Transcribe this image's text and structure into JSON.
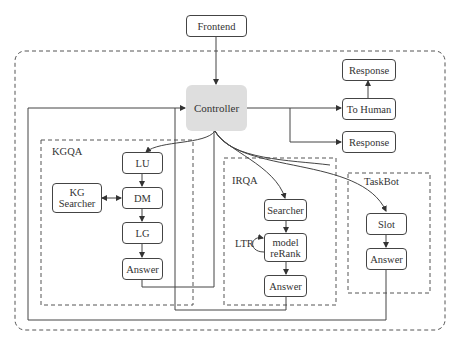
{
  "diagram": {
    "nodes": {
      "frontend": "Frontend",
      "controller": "Controller",
      "response_top": "Response",
      "to_human": "To Human",
      "response_bottom": "Response",
      "kgqa_lu": "LU",
      "kgqa_dm": "DM",
      "kgqa_lg": "LG",
      "kgqa_answer": "Answer",
      "kg_searcher": "KG Searcher",
      "irqa_searcher": "Searcher",
      "irqa_rerank": "model reRank",
      "irqa_answer": "Answer",
      "taskbot_slot": "Slot",
      "taskbot_answer": "Answer"
    },
    "groups": {
      "kgqa": "KGQA",
      "irqa": "IRQA",
      "taskbot": "TaskBot"
    },
    "edge_labels": {
      "ltr": "LTR"
    },
    "colors": {
      "line": "#444444",
      "controller_fill": "#dedede",
      "dashed": "#555555"
    }
  }
}
